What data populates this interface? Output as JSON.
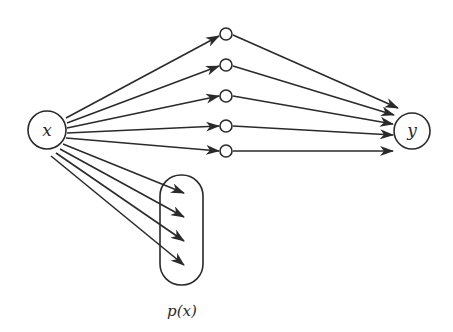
{
  "diagram": {
    "type": "network-graph",
    "colors": {
      "stroke": "#2a2a2a",
      "background": "#ffffff"
    },
    "nodes": {
      "input": {
        "label": "x",
        "cx": 47,
        "cy": 130,
        "r": 19
      },
      "output": {
        "label": "y",
        "cx": 412,
        "cy": 131,
        "r": 18
      },
      "hidden": [
        {
          "cx": 226,
          "cy": 34,
          "r": 6
        },
        {
          "cx": 226,
          "cy": 65,
          "r": 6
        },
        {
          "cx": 226,
          "cy": 96,
          "r": 6
        },
        {
          "cx": 226,
          "cy": 126,
          "r": 6
        },
        {
          "cx": 226,
          "cy": 151,
          "r": 6
        }
      ],
      "distribution": {
        "label": "p(x)",
        "x": 160,
        "y": 175,
        "width": 43,
        "height": 110,
        "rx": 21
      }
    },
    "edges_input_to_hidden": [
      {
        "x1": 66,
        "y1": 118,
        "x2": 219,
        "y2": 36
      },
      {
        "x1": 67,
        "y1": 123,
        "x2": 219,
        "y2": 66
      },
      {
        "x1": 67,
        "y1": 128,
        "x2": 219,
        "y2": 96
      },
      {
        "x1": 67,
        "y1": 133,
        "x2": 219,
        "y2": 126
      },
      {
        "x1": 66,
        "y1": 138,
        "x2": 219,
        "y2": 151
      }
    ],
    "edges_hidden_to_output": [
      {
        "x1": 233,
        "y1": 35,
        "x2": 398,
        "y2": 108
      },
      {
        "x1": 233,
        "y1": 66,
        "x2": 394,
        "y2": 115
      },
      {
        "x1": 233,
        "y1": 96,
        "x2": 393,
        "y2": 124
      },
      {
        "x1": 233,
        "y1": 126,
        "x2": 393,
        "y2": 135
      },
      {
        "x1": 233,
        "y1": 151,
        "x2": 393,
        "y2": 151
      }
    ],
    "edges_input_to_distribution": [
      {
        "x1": 63,
        "y1": 144,
        "x2": 184,
        "y2": 193
      },
      {
        "x1": 60,
        "y1": 149,
        "x2": 184,
        "y2": 217
      },
      {
        "x1": 56,
        "y1": 153,
        "x2": 184,
        "y2": 241
      },
      {
        "x1": 51,
        "y1": 156,
        "x2": 184,
        "y2": 265
      }
    ],
    "caption": {
      "text": "p(x)",
      "x": 182,
      "y": 316
    }
  }
}
